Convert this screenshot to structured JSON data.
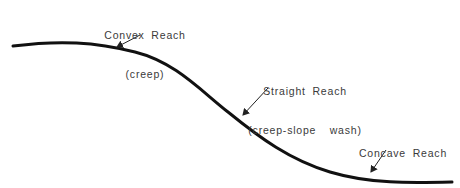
{
  "diagram": {
    "title": "",
    "stroke_color": "#111111",
    "text_color": "#3a3a3a",
    "labels": [
      {
        "id": "convex",
        "name": "Convex Reach",
        "process": "(creep)"
      },
      {
        "id": "straight",
        "name": "Straight Reach",
        "process": "(creep-slope  wash)"
      },
      {
        "id": "concave",
        "name": "Concave Reach",
        "process": "(slopewash)"
      }
    ]
  }
}
